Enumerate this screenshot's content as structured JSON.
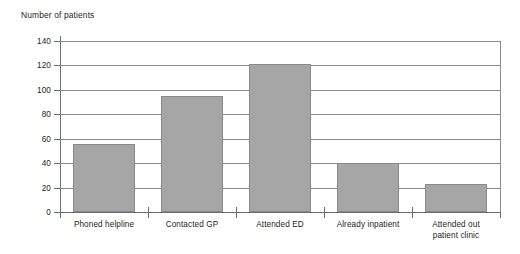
{
  "chart_data": {
    "type": "bar",
    "title": "Number of patients",
    "xlabel": "",
    "ylabel": "Number of patients",
    "categories": [
      "Phoned helpline",
      "Contacted GP",
      "Attended ED",
      "Already inpatient",
      "Attended out\npatient clinic"
    ],
    "category_lines": [
      [
        "Phoned helpline"
      ],
      [
        "Contacted GP"
      ],
      [
        "Attended ED"
      ],
      [
        "Already inpatient"
      ],
      [
        "Attended out",
        "patient clinic"
      ]
    ],
    "values": [
      56,
      95,
      121,
      40,
      23
    ],
    "ylim": [
      0,
      140
    ],
    "yticks": [
      0,
      20,
      40,
      60,
      80,
      100,
      120,
      140
    ],
    "ytick_labels": [
      "0",
      "20",
      "40",
      "60",
      "80",
      "100",
      "120",
      "140"
    ],
    "grid": true,
    "legend": false,
    "bar_color": "#a6a6a6",
    "bar_border_color": "#8a8a8a",
    "axis_color": "#6d6d6d",
    "grid_color": "#8c8c8c",
    "text_color": "#231f20"
  }
}
